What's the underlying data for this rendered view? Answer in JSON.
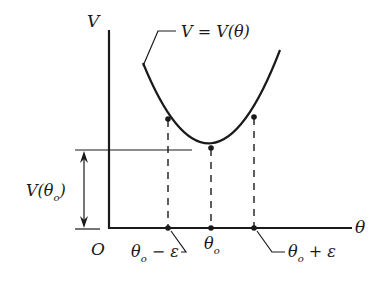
{
  "diagram": {
    "type": "potential-well",
    "axes": {
      "y_label": "V",
      "x_label": "θ",
      "origin_label": "O"
    },
    "curve_label": "V = V(θ)",
    "points": [
      {
        "name": "left",
        "label_main": "θ",
        "label_sub": "o",
        "label_suffix": " − ε"
      },
      {
        "name": "minimum",
        "label_main": "θ",
        "label_sub": "o",
        "label_suffix": ""
      },
      {
        "name": "right",
        "label_main": "θ",
        "label_sub": "o",
        "label_suffix": " + ε"
      }
    ],
    "height_marker": {
      "label_main": "V(θ",
      "label_sub": "o",
      "label_close": ")"
    },
    "colors": {
      "ink": "#1a1a1a",
      "background": "#ffffff"
    }
  }
}
